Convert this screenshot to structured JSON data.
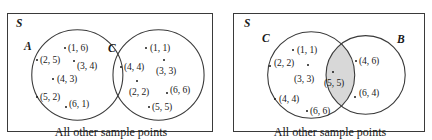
{
  "figure": {
    "type": "venn-diagram-pair",
    "width": 432,
    "height": 140,
    "stroke_color": "#3a3a3a",
    "text_color": "#1a1a1a",
    "shade_color": "#d8d8d8",
    "background": "#ffffff"
  },
  "panels": [
    {
      "id": "left",
      "universe_label": "S",
      "caption": "All other sample points",
      "relationship": "disjoint",
      "circles": [
        {
          "label": "A",
          "cx": 70,
          "cy": 62,
          "r": 46,
          "label_x": 16,
          "label_y": 34,
          "shaded": false,
          "points": [
            {
              "text": "(1, 6)",
              "dot_x": 56,
              "dot_y": 33,
              "label_x": 60,
              "label_y": 29
            },
            {
              "text": "(2, 5)",
              "dot_x": 28,
              "dot_y": 45,
              "label_x": 32,
              "label_y": 41
            },
            {
              "text": "(3, 4)",
              "dot_x": 65,
              "dot_y": 46,
              "label_x": 69,
              "label_y": 47
            },
            {
              "text": "(4, 3)",
              "dot_x": 44,
              "dot_y": 64,
              "label_x": 49,
              "label_y": 60
            },
            {
              "text": "(5, 2)",
              "dot_x": 28,
              "dot_y": 82,
              "label_x": 32,
              "label_y": 78
            },
            {
              "text": "(6, 1)",
              "dot_x": 57,
              "dot_y": 92,
              "label_x": 61,
              "label_y": 85
            }
          ]
        },
        {
          "label": "C",
          "cx": 152,
          "cy": 62,
          "r": 46,
          "label_x": 100,
          "label_y": 36,
          "shaded": false,
          "points": [
            {
              "text": "(1, 1)",
              "dot_x": 137,
              "dot_y": 33,
              "label_x": 142,
              "label_y": 29
            },
            {
              "text": "(4, 4)",
              "dot_x": 112,
              "dot_y": 52,
              "label_x": 116,
              "label_y": 48
            },
            {
              "text": "(3, 3)",
              "dot_x": 155,
              "dot_y": 45,
              "label_x": 148,
              "label_y": 52
            },
            {
              "text": "(2, 2)",
              "dot_x": 128,
              "dot_y": 66,
              "label_x": 121,
              "label_y": 73
            },
            {
              "text": "(6, 6)",
              "dot_x": 158,
              "dot_y": 78,
              "label_x": 162,
              "label_y": 71
            },
            {
              "text": "(5, 5)",
              "dot_x": 140,
              "dot_y": 92,
              "label_x": 144,
              "label_y": 88
            }
          ]
        }
      ]
    },
    {
      "id": "right",
      "universe_label": "S",
      "caption": "All other sample points",
      "relationship": "intersecting",
      "circles": [
        {
          "label": "C",
          "cx": 78,
          "cy": 62,
          "r": 44,
          "label_x": 28,
          "label_y": 26,
          "shaded": false,
          "points": [
            {
              "text": "(1, 1)",
              "dot_x": 58,
              "dot_y": 35,
              "label_x": 63,
              "label_y": 31
            },
            {
              "text": "(2, 2)",
              "dot_x": 35,
              "dot_y": 51,
              "label_x": 40,
              "label_y": 44
            },
            {
              "text": "(3, 3)",
              "dot_x": 73,
              "dot_y": 50,
              "label_x": 60,
              "label_y": 60
            },
            {
              "text": "(4, 4)",
              "dot_x": 40,
              "dot_y": 84,
              "label_x": 45,
              "label_y": 80
            },
            {
              "text": "(6, 6)",
              "dot_x": 72,
              "dot_y": 96,
              "label_x": 76,
              "label_y": 92
            }
          ]
        },
        {
          "label": "B",
          "cx": 133,
          "cy": 62,
          "r": 40,
          "label_x": 163,
          "label_y": 27,
          "shaded": false,
          "points": [
            {
              "text": "(4, 6)",
              "dot_x": 121,
              "dot_y": 46,
              "label_x": 125,
              "label_y": 42
            },
            {
              "text": "(6, 4)",
              "dot_x": 120,
              "dot_y": 82,
              "label_x": 125,
              "label_y": 74
            }
          ]
        }
      ],
      "intersection": {
        "shaded": true,
        "shade_color": "#d8d8d8",
        "points": [
          {
            "text": "(5, 5)",
            "dot_x": 98,
            "dot_y": 57,
            "label_x": 90,
            "label_y": 64
          }
        ]
      }
    }
  ]
}
